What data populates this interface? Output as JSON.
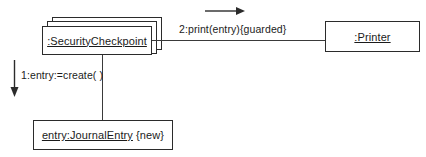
{
  "diagram": {
    "kind": "uml-communication-diagram",
    "background_color": "#ffffff",
    "line_color": "#3a3a3a",
    "text_color": "#1b1b1b"
  },
  "objects": [
    {
      "id": "security-checkpoint",
      "label": ":SecurityCheckpoint",
      "underlined_text": ":SecurityCheckpoint",
      "plain_text": "",
      "multiobject": true,
      "stack_layers": 3
    },
    {
      "id": "printer",
      "label": ":Printer",
      "underlined_text": ":Printer",
      "plain_text": "",
      "multiobject": false,
      "stack_layers": 1
    },
    {
      "id": "journal-entry",
      "label": "entry:JournalEntry {new}",
      "underlined_text": "entry:JournalEntry",
      "plain_text": " {new}",
      "multiobject": false,
      "stack_layers": 1
    }
  ],
  "messages": [
    {
      "id": "msg-print",
      "sequence": "2",
      "label": "2:print(entry){guarded}",
      "direction": "right",
      "from": "security-checkpoint",
      "to": "printer"
    },
    {
      "id": "msg-create",
      "sequence": "1",
      "label": "1:entry:=create( )",
      "direction": "down",
      "from": "security-checkpoint",
      "to": "journal-entry"
    }
  ]
}
